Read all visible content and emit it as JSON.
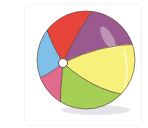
{
  "image": {
    "subject": "beach ball",
    "alt": "Colorful beach ball illustration",
    "colors": {
      "red": "#e8453a",
      "purple": "#9a5a90",
      "yellow": "#f7f07a",
      "green": "#a6cf55",
      "pink": "#e06b8c",
      "blue": "#7fbfe8",
      "valve": "#ffffff",
      "outline": "#5a3a3a",
      "shadow": "#dcdce4"
    }
  }
}
